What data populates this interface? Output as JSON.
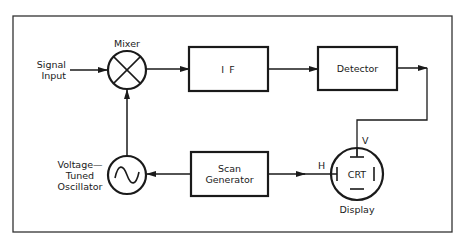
{
  "diagram": {
    "type": "block-diagram",
    "colors": {
      "stroke": "#1a1a1a",
      "background": "#ffffff"
    },
    "nodes": {
      "signal_input": {
        "label_line1": "Signal",
        "label_line2": "Input"
      },
      "mixer": {
        "label": "Mixer",
        "symbol": "circle-x"
      },
      "if": {
        "label": "I F"
      },
      "detector": {
        "label": "Detector"
      },
      "vto": {
        "label_line1": "Voltage—",
        "label_line2": "Tuned",
        "label_line3": "Oscillator",
        "symbol": "sine-wave-circle"
      },
      "scan_generator": {
        "label_line1": "Scan",
        "label_line2": "Generator"
      },
      "display": {
        "label": "Display",
        "inner_label": "CRT",
        "h_label": "H",
        "v_label": "V"
      }
    },
    "edges": [
      {
        "from": "signal_input",
        "to": "mixer"
      },
      {
        "from": "mixer",
        "to": "if"
      },
      {
        "from": "if",
        "to": "detector"
      },
      {
        "from": "detector",
        "to": "display",
        "port": "V"
      },
      {
        "from": "vto",
        "to": "mixer"
      },
      {
        "from": "scan_generator",
        "to": "vto"
      },
      {
        "from": "scan_generator",
        "to": "display",
        "port": "H"
      }
    ]
  }
}
